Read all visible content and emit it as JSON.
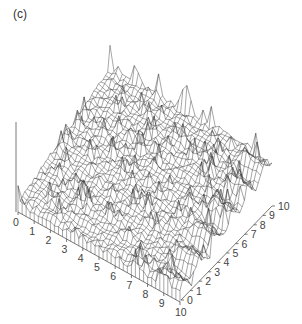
{
  "panel_label": "(c)",
  "chart_data": {
    "type": "surface3d-wireframe",
    "title": "",
    "panel": "(c)",
    "x_axis": {
      "label": "",
      "ticks": [
        "0",
        "1",
        "2",
        "3",
        "4",
        "5",
        "6",
        "7",
        "8",
        "9",
        "10"
      ],
      "range": [
        0,
        10
      ]
    },
    "y_axis": {
      "label": "",
      "ticks": [
        "0",
        "1",
        "2",
        "3",
        "4",
        "5",
        "6",
        "7",
        "8",
        "9",
        "10"
      ],
      "range": [
        0,
        10
      ]
    },
    "z_axis": {
      "label": "",
      "ticks": [],
      "shown_as": "vertical line without tick labels"
    },
    "grid": false,
    "colors": {
      "mesh": "#3a3a3a",
      "axis": "#555555",
      "background": "#ffffff"
    }
  }
}
